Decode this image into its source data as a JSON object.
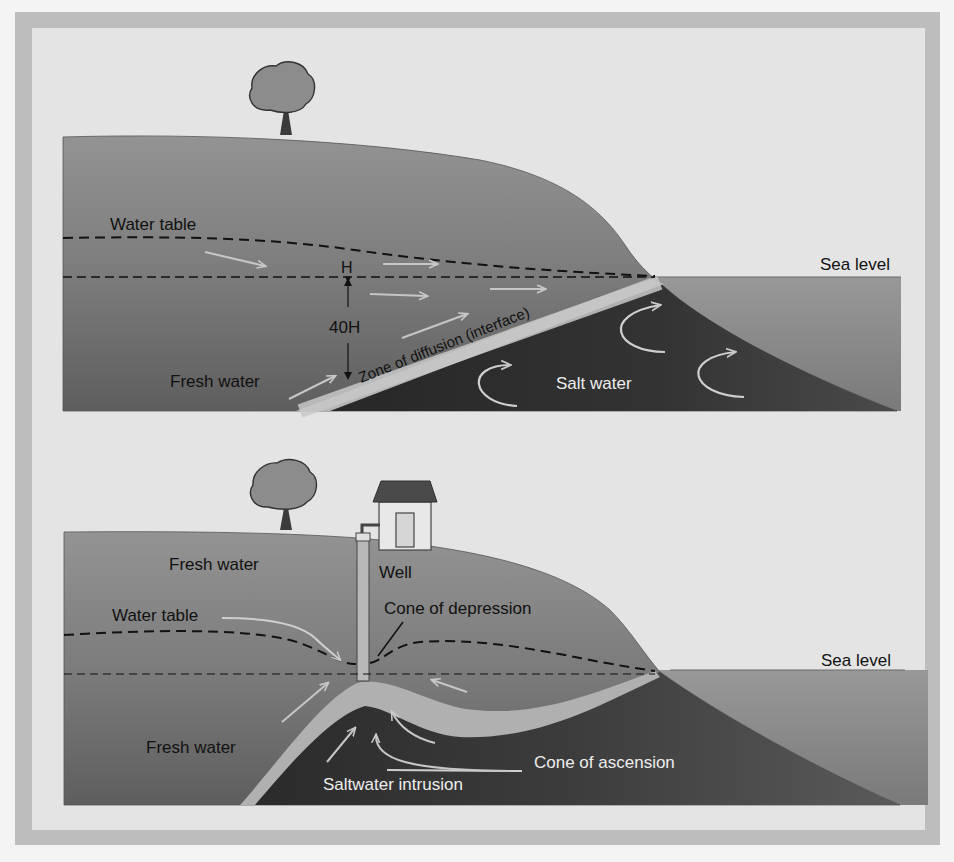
{
  "colors": {
    "page_bg": "#f4f4f4",
    "frame_outer": "#bdbdbd",
    "panel_bg": "#e4e4e4",
    "land_top": "#8e8e8e",
    "land_mid": "#7a7a7a",
    "land_deep": "#5a5a5a",
    "sea": "#8f8f8f",
    "sea_deep": "#7c7c7c",
    "salt_water": "#2e2e2e",
    "interface_band": "#b4b4b4",
    "arrow": "#c4c4c4",
    "text_dark": "#111111",
    "text_light": "#eeeeee"
  },
  "top_panel": {
    "labels": {
      "water_table": "Water table",
      "sea_level": "Sea level",
      "h": "H",
      "forty_h": "40H",
      "fresh_water": "Fresh water",
      "zone_of_diffusion": "Zone of diffusion (interface)",
      "salt_water": "Salt water"
    },
    "icons": [
      "tree-icon"
    ]
  },
  "bottom_panel": {
    "labels": {
      "fresh_water_upper": "Fresh water",
      "well": "Well",
      "water_table": "Water table",
      "cone_of_depression": "Cone of depression",
      "sea_level": "Sea level",
      "fresh_water_lower": "Fresh water",
      "cone_of_ascension": "Cone of ascension",
      "saltwater_intrusion": "Saltwater intrusion"
    },
    "icons": [
      "tree-icon",
      "house-icon",
      "well-pipe-icon"
    ]
  }
}
